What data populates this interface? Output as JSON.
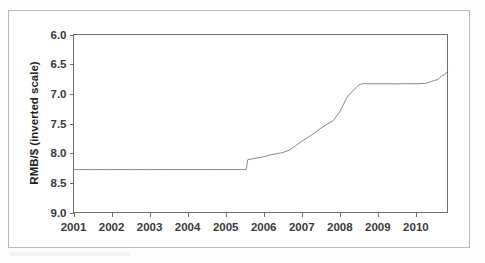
{
  "figure": {
    "axis_title_y": "RMB/$ (inverted scale)",
    "axis_title_x": "",
    "title": "",
    "frame_color": "#b9b9b9",
    "line_color": "#8a8a8a",
    "axis_color": "#6f6f6f",
    "background": "#ffffff"
  },
  "chart_data": {
    "type": "line",
    "title": "",
    "subtitle": "",
    "xlabel": "",
    "ylabel": "RMB/$ (inverted scale)",
    "y_inverted": true,
    "grid": false,
    "legend": "none",
    "xlim": [
      2001.0,
      2010.83
    ],
    "ylim": [
      6.0,
      9.0
    ],
    "y_ticks": [
      "6.0",
      "6.5",
      "7.0",
      "7.5",
      "8.0",
      "8.5",
      "9.0"
    ],
    "y_tick_values": [
      6.0,
      6.5,
      7.0,
      7.5,
      8.0,
      8.5,
      9.0
    ],
    "x_ticks": [
      "2001",
      "2002",
      "2003",
      "2004",
      "2005",
      "2006",
      "2007",
      "2008",
      "2009",
      "2010"
    ],
    "x_tick_values": [
      2001,
      2002,
      2003,
      2004,
      2005,
      2006,
      2007,
      2008,
      2009,
      2010
    ],
    "series": [
      {
        "name": "RMB per USD",
        "x": [
          2001.0,
          2001.25,
          2001.5,
          2001.75,
          2002.0,
          2002.25,
          2002.5,
          2002.75,
          2003.0,
          2003.25,
          2003.5,
          2003.75,
          2004.0,
          2004.25,
          2004.5,
          2004.75,
          2005.0,
          2005.25,
          2005.45,
          2005.54,
          2005.58,
          2005.75,
          2005.92,
          2006.0,
          2006.17,
          2006.33,
          2006.5,
          2006.67,
          2006.83,
          2007.0,
          2007.17,
          2007.33,
          2007.5,
          2007.67,
          2007.83,
          2008.0,
          2008.08,
          2008.17,
          2008.25,
          2008.33,
          2008.42,
          2008.5,
          2008.58,
          2008.67,
          2008.83,
          2009.0,
          2009.25,
          2009.5,
          2009.75,
          2010.0,
          2010.25,
          2010.42,
          2010.5,
          2010.58,
          2010.67,
          2010.75,
          2010.83
        ],
        "values": [
          8.277,
          8.277,
          8.277,
          8.277,
          8.277,
          8.277,
          8.277,
          8.277,
          8.277,
          8.277,
          8.277,
          8.277,
          8.277,
          8.277,
          8.277,
          8.277,
          8.277,
          8.277,
          8.277,
          8.277,
          8.11,
          8.09,
          8.07,
          8.06,
          8.03,
          8.01,
          7.99,
          7.95,
          7.88,
          7.8,
          7.73,
          7.66,
          7.58,
          7.51,
          7.45,
          7.3,
          7.2,
          7.08,
          7.01,
          6.96,
          6.9,
          6.85,
          6.83,
          6.828,
          6.83,
          6.83,
          6.83,
          6.832,
          6.828,
          6.83,
          6.825,
          6.79,
          6.77,
          6.76,
          6.7,
          6.68,
          6.62
        ]
      }
    ],
    "annotations": [
      {
        "text": "peg at 8.28 until July 2005",
        "x": 2003.0,
        "y": 8.277,
        "visible": false
      }
    ]
  }
}
